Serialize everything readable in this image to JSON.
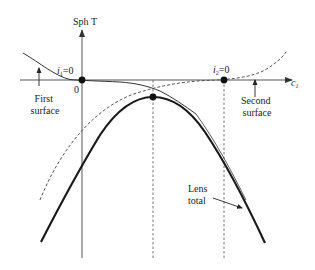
{
  "diagram": {
    "axes": {
      "y_label": "Sph T",
      "x_label": "c",
      "x_label_subscript": "1",
      "origin_label": "0"
    },
    "annotations": {
      "i1": {
        "text": "i",
        "subscript": "1",
        "suffix": "=0"
      },
      "i2": {
        "text": "i",
        "subscript": "2",
        "suffix": "=0"
      },
      "first_surface": [
        "First",
        "surface"
      ],
      "second_surface": [
        "Second",
        "surface"
      ],
      "lens_total": [
        "Lens",
        "total"
      ]
    },
    "curves": [
      {
        "name": "First surface",
        "style": "solid thin"
      },
      {
        "name": "Second surface",
        "style": "dashed"
      },
      {
        "name": "Lens total",
        "style": "solid thick"
      }
    ],
    "markers": [
      {
        "name": "i1=0 point (origin)"
      },
      {
        "name": "i2=0 point"
      },
      {
        "name": "Lens total maximum"
      }
    ],
    "colors": {
      "ink": "#1a1a1a",
      "axis": "#555555",
      "dash": "#555555"
    }
  }
}
